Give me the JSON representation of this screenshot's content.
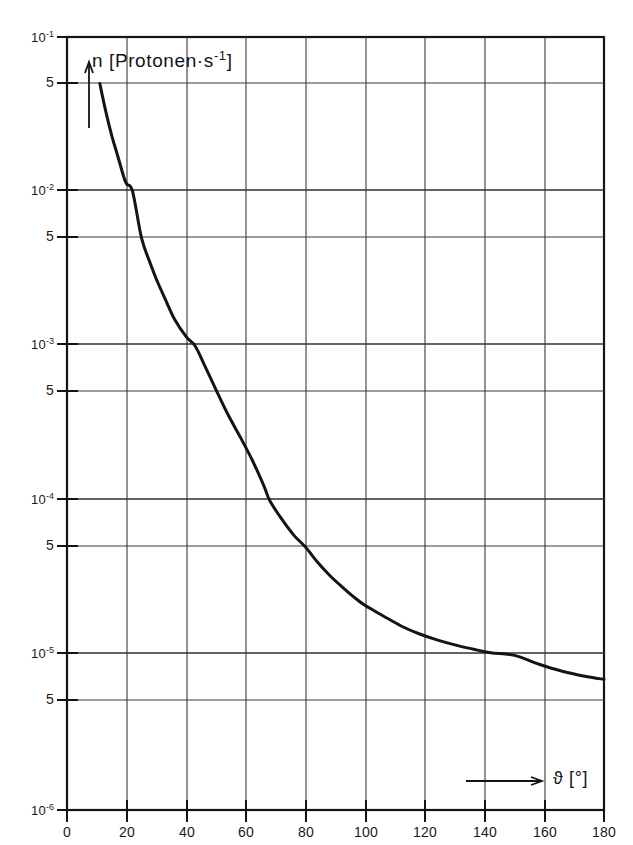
{
  "chart_data": {
    "type": "line",
    "title": "",
    "subtitle": "",
    "xlabel": "ϑ [°]",
    "ylabel": "n [Protonen·s⁻¹]",
    "yscale": "log",
    "xscale": "linear",
    "xlim": [
      0,
      180
    ],
    "ylim": [
      1e-06,
      0.1
    ],
    "grid": true,
    "legend": null,
    "series": [
      {
        "name": "n(ϑ)",
        "x": [
          11,
          13,
          15,
          17,
          19,
          20,
          22,
          25,
          28,
          30,
          33,
          36,
          40,
          43,
          46,
          50,
          54,
          58,
          62,
          66,
          68,
          72,
          76,
          80,
          84,
          88,
          92,
          96,
          100,
          106,
          112,
          118,
          124,
          130,
          136,
          142,
          150,
          158,
          166,
          174,
          180
        ],
        "y": [
          0.05,
          0.033,
          0.023,
          0.017,
          0.0125,
          0.0112,
          0.01,
          0.005,
          0.0034,
          0.0027,
          0.002,
          0.0015,
          0.00115,
          0.001,
          0.00076,
          0.00052,
          0.00036,
          0.00026,
          0.000185,
          0.000125,
          0.0001,
          7.6e-05,
          6e-05,
          5e-05,
          4e-05,
          3.3e-05,
          2.8e-05,
          2.4e-05,
          2.1e-05,
          1.8e-05,
          1.55e-05,
          1.38e-05,
          1.26e-05,
          1.17e-05,
          1.1e-05,
          1.04e-05,
          1e-05,
          8.8e-06,
          7.9e-06,
          7.3e-06,
          7e-06
        ]
      }
    ],
    "x_ticks": [
      {
        "value": 0,
        "label": "0"
      },
      {
        "value": 20,
        "label": "20"
      },
      {
        "value": 40,
        "label": "40"
      },
      {
        "value": 60,
        "label": "60"
      },
      {
        "value": 80,
        "label": "80"
      },
      {
        "value": 100,
        "label": "100"
      },
      {
        "value": 120,
        "label": "120"
      },
      {
        "value": 140,
        "label": "140"
      },
      {
        "value": 160,
        "label": "160"
      },
      {
        "value": 180,
        "label": "180"
      }
    ],
    "y_ticks": [
      {
        "value": 0.1,
        "mantissa": "10",
        "exponent": "-1",
        "major": true
      },
      {
        "value": 0.05,
        "label": "5",
        "major": false
      },
      {
        "value": 0.01,
        "mantissa": "10",
        "exponent": "-2",
        "major": true
      },
      {
        "value": 0.005,
        "label": "5",
        "major": false
      },
      {
        "value": 0.001,
        "mantissa": "10",
        "exponent": "-3",
        "major": true
      },
      {
        "value": 0.0005,
        "label": "5",
        "major": false
      },
      {
        "value": 0.0001,
        "mantissa": "10",
        "exponent": "-4",
        "major": true
      },
      {
        "value": 5e-05,
        "label": "5",
        "major": false
      },
      {
        "value": 1e-05,
        "mantissa": "10",
        "exponent": "-5",
        "major": true
      },
      {
        "value": 5e-06,
        "label": "5",
        "major": false
      },
      {
        "value": 1e-06,
        "mantissa": "10",
        "exponent": "-6",
        "major": true
      }
    ],
    "annotations": [
      {
        "name": "y-axis-arrow",
        "direction": "up"
      },
      {
        "name": "x-axis-arrow",
        "direction": "right"
      }
    ]
  },
  "axes": {
    "y_caption_base": "n [Protonen·s",
    "y_caption_exp": "-1",
    "y_caption_close": "]",
    "x_caption": "ϑ [°]"
  },
  "style": {
    "curve_color": "#141414",
    "grid_color": "#3a3a3a",
    "frame_color": "#141414",
    "background": "#ffffff"
  }
}
